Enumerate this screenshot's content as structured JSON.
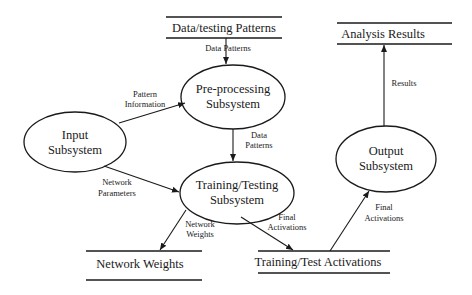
{
  "diagram": {
    "type": "data-flow-diagram",
    "processes": [
      {
        "id": "input",
        "line1": "Input",
        "line2": "Subsystem"
      },
      {
        "id": "preprocessing",
        "line1": "Pre-processing",
        "line2": "Subsystem"
      },
      {
        "id": "training",
        "line1": "Training/Testing",
        "line2": "Subsystem"
      },
      {
        "id": "output",
        "line1": "Output",
        "line2": "Subsystem"
      }
    ],
    "stores": [
      {
        "id": "data_testing_patterns",
        "label": "Data/testing Patterns"
      },
      {
        "id": "analysis_results",
        "label": "Analysis Results"
      },
      {
        "id": "network_weights",
        "label": "Network Weights"
      },
      {
        "id": "training_test_activations",
        "label": "Training/Test Activations"
      }
    ],
    "flows": [
      {
        "from": "data_testing_patterns",
        "to": "preprocessing",
        "line1": "Data Patterns",
        "line2": ""
      },
      {
        "from": "input",
        "to": "preprocessing",
        "line1": "Pattern",
        "line2": "Information"
      },
      {
        "from": "preprocessing",
        "to": "training",
        "line1": "Data",
        "line2": "Patterns"
      },
      {
        "from": "input",
        "to": "training",
        "line1": "Network",
        "line2": "Parameters"
      },
      {
        "from": "training",
        "to": "network_weights",
        "line1": "Network",
        "line2": "Weights"
      },
      {
        "from": "training",
        "to": "training_test_activations",
        "line1": "Final",
        "line2": "Activations"
      },
      {
        "from": "training_test_activations",
        "to": "output",
        "line1": "Final",
        "line2": "Activations"
      },
      {
        "from": "output",
        "to": "analysis_results",
        "line1": "Results",
        "line2": ""
      }
    ]
  }
}
